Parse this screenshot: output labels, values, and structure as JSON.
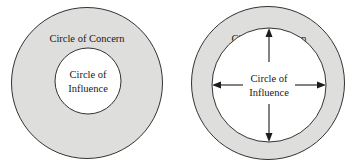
{
  "figure": {
    "background_color": "#ffffff",
    "outline_color": "#1d1d1d",
    "concern_fill_color": "#dededc",
    "influence_fill_color": "#ffffff"
  },
  "diagrams": [
    {
      "id": "proactive-focus",
      "concern_label": "Circle of Concern",
      "influence_label_line1": "Circle of",
      "influence_label_line2": "Influence",
      "has_arrows": false
    },
    {
      "id": "reactive-focus",
      "concern_label": "Circle of Concern",
      "influence_label_line1": "Circle of",
      "influence_label_line2": "Influence",
      "has_arrows": true,
      "arrows": [
        {
          "name": "arrow-up",
          "direction": "up"
        },
        {
          "name": "arrow-down",
          "direction": "down"
        },
        {
          "name": "arrow-left",
          "direction": "left"
        },
        {
          "name": "arrow-right",
          "direction": "right"
        }
      ]
    }
  ]
}
